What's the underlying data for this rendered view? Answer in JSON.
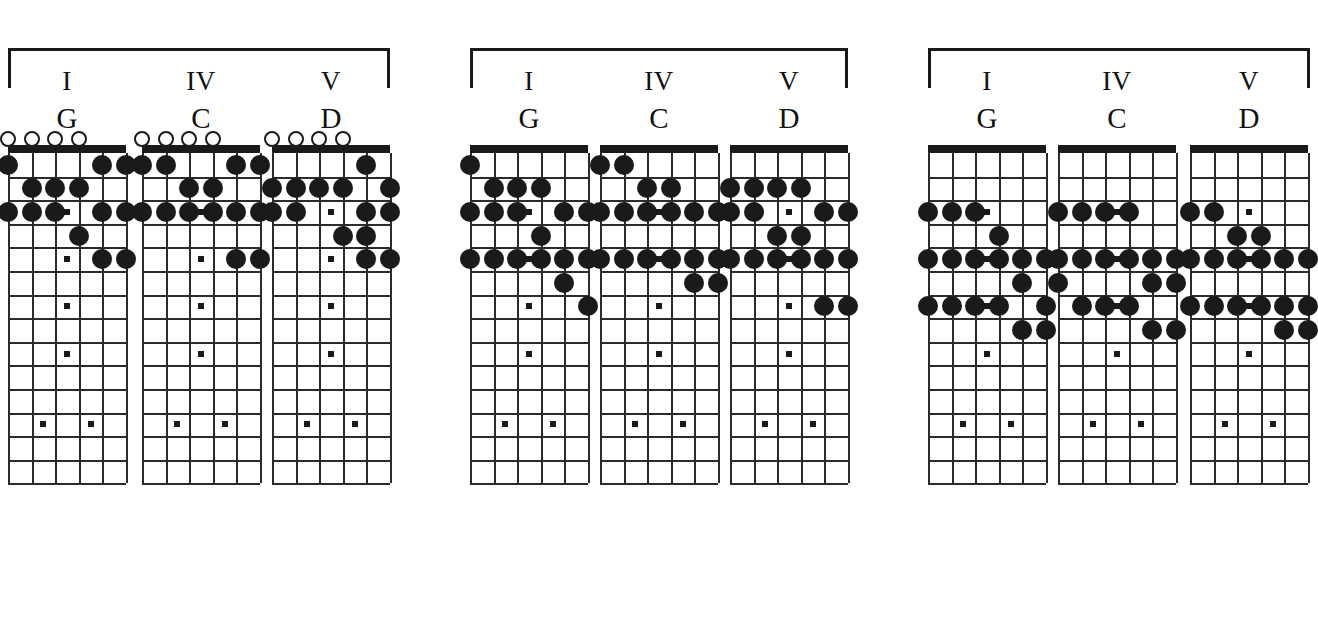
{
  "page": {
    "background_color": "#ffffff",
    "ink_color": "#1a1a1a"
  },
  "diagram": {
    "strings": 6,
    "frets": 14,
    "open_circle_symbol": "open-string-circle",
    "filled_dot_symbol": "fretted-note-dot",
    "inlay_symbol": "fret-inlay-marker",
    "inlay_frets_single": [
      3,
      5,
      7,
      9,
      15
    ],
    "inlay_frets_double": [
      12
    ]
  },
  "groups": [
    {
      "name": "position-1",
      "bracket": "chord-group-bracket",
      "charts": [
        {
          "name": "chart-g-open",
          "roman": "I",
          "chord": "G",
          "open_strings": [
            1,
            2,
            3,
            4
          ],
          "notes": [
            {
              "string": 1,
              "fret": 1
            },
            {
              "string": 5,
              "fret": 1
            },
            {
              "string": 6,
              "fret": 1
            },
            {
              "string": 2,
              "fret": 2
            },
            {
              "string": 3,
              "fret": 2
            },
            {
              "string": 4,
              "fret": 2
            },
            {
              "string": 1,
              "fret": 3
            },
            {
              "string": 2,
              "fret": 3
            },
            {
              "string": 3,
              "fret": 3
            },
            {
              "string": 5,
              "fret": 3
            },
            {
              "string": 6,
              "fret": 3
            },
            {
              "string": 4,
              "fret": 4
            },
            {
              "string": 5,
              "fret": 5
            },
            {
              "string": 6,
              "fret": 5
            }
          ]
        },
        {
          "name": "chart-c-open",
          "roman": "IV",
          "chord": "C",
          "open_strings": [
            1,
            2,
            3,
            4
          ],
          "notes": [
            {
              "string": 1,
              "fret": 1
            },
            {
              "string": 2,
              "fret": 1
            },
            {
              "string": 5,
              "fret": 1
            },
            {
              "string": 6,
              "fret": 1
            },
            {
              "string": 3,
              "fret": 2
            },
            {
              "string": 4,
              "fret": 2
            },
            {
              "string": 1,
              "fret": 3
            },
            {
              "string": 2,
              "fret": 3
            },
            {
              "string": 3,
              "fret": 3
            },
            {
              "string": 4,
              "fret": 3
            },
            {
              "string": 5,
              "fret": 3
            },
            {
              "string": 6,
              "fret": 3
            },
            {
              "string": 5,
              "fret": 5
            },
            {
              "string": 6,
              "fret": 5
            }
          ]
        },
        {
          "name": "chart-d-open",
          "roman": "V",
          "chord": "D",
          "open_strings": [
            1,
            2,
            3,
            4
          ],
          "notes": [
            {
              "string": 5,
              "fret": 1
            },
            {
              "string": 1,
              "fret": 2
            },
            {
              "string": 2,
              "fret": 2
            },
            {
              "string": 3,
              "fret": 2
            },
            {
              "string": 4,
              "fret": 2
            },
            {
              "string": 6,
              "fret": 2
            },
            {
              "string": 1,
              "fret": 3
            },
            {
              "string": 2,
              "fret": 3
            },
            {
              "string": 5,
              "fret": 3
            },
            {
              "string": 6,
              "fret": 3
            },
            {
              "string": 4,
              "fret": 4
            },
            {
              "string": 5,
              "fret": 4
            },
            {
              "string": 5,
              "fret": 5
            },
            {
              "string": 6,
              "fret": 5
            }
          ]
        }
      ]
    },
    {
      "name": "position-2",
      "bracket": "chord-group-bracket",
      "charts": [
        {
          "name": "chart-g-position-2",
          "roman": "I",
          "chord": "G",
          "open_strings": [],
          "notes": [
            {
              "string": 1,
              "fret": 1
            },
            {
              "string": 2,
              "fret": 2
            },
            {
              "string": 3,
              "fret": 2
            },
            {
              "string": 4,
              "fret": 2
            },
            {
              "string": 1,
              "fret": 3
            },
            {
              "string": 2,
              "fret": 3
            },
            {
              "string": 3,
              "fret": 3
            },
            {
              "string": 5,
              "fret": 3
            },
            {
              "string": 6,
              "fret": 3
            },
            {
              "string": 4,
              "fret": 4
            },
            {
              "string": 1,
              "fret": 5
            },
            {
              "string": 2,
              "fret": 5
            },
            {
              "string": 3,
              "fret": 5
            },
            {
              "string": 4,
              "fret": 5
            },
            {
              "string": 5,
              "fret": 5
            },
            {
              "string": 6,
              "fret": 5
            },
            {
              "string": 5,
              "fret": 6
            },
            {
              "string": 6,
              "fret": 7
            }
          ]
        },
        {
          "name": "chart-c-position-2",
          "roman": "IV",
          "chord": "C",
          "open_strings": [],
          "notes": [
            {
              "string": 1,
              "fret": 1
            },
            {
              "string": 2,
              "fret": 1
            },
            {
              "string": 3,
              "fret": 2
            },
            {
              "string": 4,
              "fret": 2
            },
            {
              "string": 1,
              "fret": 3
            },
            {
              "string": 2,
              "fret": 3
            },
            {
              "string": 3,
              "fret": 3
            },
            {
              "string": 4,
              "fret": 3
            },
            {
              "string": 5,
              "fret": 3
            },
            {
              "string": 6,
              "fret": 3
            },
            {
              "string": 1,
              "fret": 5
            },
            {
              "string": 2,
              "fret": 5
            },
            {
              "string": 3,
              "fret": 5
            },
            {
              "string": 4,
              "fret": 5
            },
            {
              "string": 5,
              "fret": 5
            },
            {
              "string": 6,
              "fret": 5
            },
            {
              "string": 5,
              "fret": 6
            },
            {
              "string": 6,
              "fret": 6
            }
          ]
        },
        {
          "name": "chart-d-position-2",
          "roman": "V",
          "chord": "D",
          "open_strings": [],
          "notes": [
            {
              "string": 1,
              "fret": 2
            },
            {
              "string": 2,
              "fret": 2
            },
            {
              "string": 3,
              "fret": 2
            },
            {
              "string": 4,
              "fret": 2
            },
            {
              "string": 1,
              "fret": 3
            },
            {
              "string": 2,
              "fret": 3
            },
            {
              "string": 5,
              "fret": 3
            },
            {
              "string": 6,
              "fret": 3
            },
            {
              "string": 3,
              "fret": 4
            },
            {
              "string": 4,
              "fret": 4
            },
            {
              "string": 1,
              "fret": 5
            },
            {
              "string": 2,
              "fret": 5
            },
            {
              "string": 3,
              "fret": 5
            },
            {
              "string": 4,
              "fret": 5
            },
            {
              "string": 5,
              "fret": 5
            },
            {
              "string": 6,
              "fret": 5
            },
            {
              "string": 5,
              "fret": 7
            },
            {
              "string": 6,
              "fret": 7
            }
          ]
        }
      ]
    },
    {
      "name": "position-3",
      "bracket": "chord-group-bracket",
      "charts": [
        {
          "name": "chart-g-position-3",
          "roman": "I",
          "chord": "G",
          "open_strings": [],
          "notes": [
            {
              "string": 1,
              "fret": 3
            },
            {
              "string": 2,
              "fret": 3
            },
            {
              "string": 3,
              "fret": 3
            },
            {
              "string": 4,
              "fret": 4
            },
            {
              "string": 1,
              "fret": 5
            },
            {
              "string": 2,
              "fret": 5
            },
            {
              "string": 3,
              "fret": 5
            },
            {
              "string": 4,
              "fret": 5
            },
            {
              "string": 5,
              "fret": 5
            },
            {
              "string": 6,
              "fret": 5
            },
            {
              "string": 5,
              "fret": 6
            },
            {
              "string": 1,
              "fret": 7
            },
            {
              "string": 2,
              "fret": 7
            },
            {
              "string": 3,
              "fret": 7
            },
            {
              "string": 4,
              "fret": 7
            },
            {
              "string": 6,
              "fret": 7
            },
            {
              "string": 5,
              "fret": 8
            },
            {
              "string": 6,
              "fret": 8
            }
          ]
        },
        {
          "name": "chart-c-position-3",
          "roman": "IV",
          "chord": "C",
          "open_strings": [],
          "notes": [
            {
              "string": 1,
              "fret": 3
            },
            {
              "string": 2,
              "fret": 3
            },
            {
              "string": 3,
              "fret": 3
            },
            {
              "string": 4,
              "fret": 3
            },
            {
              "string": 1,
              "fret": 5
            },
            {
              "string": 2,
              "fret": 5
            },
            {
              "string": 3,
              "fret": 5
            },
            {
              "string": 4,
              "fret": 5
            },
            {
              "string": 5,
              "fret": 5
            },
            {
              "string": 6,
              "fret": 5
            },
            {
              "string": 1,
              "fret": 6
            },
            {
              "string": 5,
              "fret": 6
            },
            {
              "string": 6,
              "fret": 6
            },
            {
              "string": 2,
              "fret": 7
            },
            {
              "string": 3,
              "fret": 7
            },
            {
              "string": 4,
              "fret": 7
            },
            {
              "string": 5,
              "fret": 8
            },
            {
              "string": 6,
              "fret": 8
            }
          ]
        },
        {
          "name": "chart-d-position-3",
          "roman": "V",
          "chord": "D",
          "open_strings": [],
          "notes": [
            {
              "string": 1,
              "fret": 3
            },
            {
              "string": 2,
              "fret": 3
            },
            {
              "string": 3,
              "fret": 4
            },
            {
              "string": 4,
              "fret": 4
            },
            {
              "string": 1,
              "fret": 5
            },
            {
              "string": 2,
              "fret": 5
            },
            {
              "string": 3,
              "fret": 5
            },
            {
              "string": 4,
              "fret": 5
            },
            {
              "string": 5,
              "fret": 5
            },
            {
              "string": 6,
              "fret": 5
            },
            {
              "string": 1,
              "fret": 7
            },
            {
              "string": 2,
              "fret": 7
            },
            {
              "string": 3,
              "fret": 7
            },
            {
              "string": 4,
              "fret": 7
            },
            {
              "string": 5,
              "fret": 7
            },
            {
              "string": 6,
              "fret": 7
            },
            {
              "string": 5,
              "fret": 8
            },
            {
              "string": 6,
              "fret": 8
            }
          ]
        }
      ]
    }
  ]
}
